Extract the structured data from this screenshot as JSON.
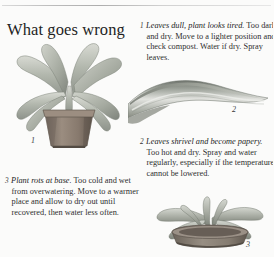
{
  "page": {
    "title": "What goes wrong",
    "background_color": "#fbfbfa",
    "text_color": "#2e2e2e",
    "rule_color": "#b9b9b9"
  },
  "entries": [
    {
      "number": "1",
      "lead": "Leaves dull, plant looks tired.",
      "body": "Too dark and dry. Move to a lighter position and check compost. Water if dry. Spray leaves."
    },
    {
      "number": "2",
      "lead": "Leaves shrivel and become papery.",
      "body": "Too hot and dry. Spray and water regularly, especially if the temperature cannot be lowered."
    },
    {
      "number": "3",
      "lead": "Plant rots at base.",
      "body": "Too cold and wet from overwatering. Move to a warmer place and allow to dry out until recovered, then water less often."
    }
  ],
  "figures": [
    {
      "number": "1",
      "name": "drooping-potted-plant-illustration",
      "pot_color": "#8d7f74",
      "leaf_color": "#b9bdb2"
    },
    {
      "number": "2",
      "name": "shrivelled-papery-leaf-illustration",
      "leaf_color": "#9ea29b"
    },
    {
      "number": "3",
      "name": "rotting-plant-in-pot-illustration",
      "pot_color": "#8a8279",
      "leaf_color": "#a9ada4"
    }
  ]
}
